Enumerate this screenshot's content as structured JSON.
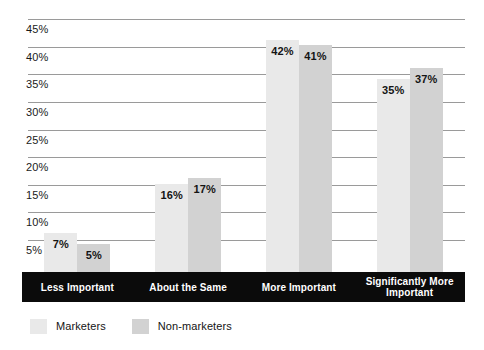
{
  "chart_data": {
    "type": "bar",
    "title": "",
    "subtitle": "",
    "xlabel": "",
    "ylabel": "",
    "grid": true,
    "legend_position": "bottom-left",
    "categories": [
      "Less Important",
      "About the Same",
      "More Important",
      "Significantly More Important"
    ],
    "series": [
      {
        "name": "Marketers",
        "color": "#e9e9e9",
        "values": [
          7,
          16,
          42,
          35
        ]
      },
      {
        "name": "Non-marketers",
        "color": "#d2d2d2",
        "values": [
          5,
          17,
          41,
          37
        ]
      }
    ],
    "value_labels": [
      [
        "7%",
        "16%",
        "42%",
        "35%"
      ],
      [
        "5%",
        "17%",
        "41%",
        "37%"
      ]
    ],
    "ylim": [
      0,
      45
    ],
    "ytick_values": [
      45,
      40,
      35,
      30,
      25,
      20,
      15,
      10,
      5
    ],
    "ytick_labels": [
      "45%",
      "40%",
      "35%",
      "30%",
      "25%",
      "20%",
      "15%",
      "10%",
      "5%"
    ],
    "value_suffix": "%"
  },
  "axis": {
    "gridline_color": "#9a9a9a",
    "category_strip_color": "#0b0b0b",
    "category_text_color": "#ffffff"
  },
  "legend": {
    "items": [
      {
        "label": "Marketers",
        "color": "#e9e9e9"
      },
      {
        "label": "Non-marketers",
        "color": "#d2d2d2"
      }
    ]
  }
}
